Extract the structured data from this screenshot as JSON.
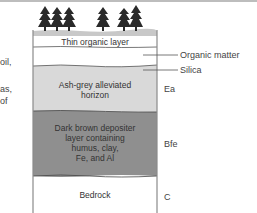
{
  "figure": {
    "left_text_fragments": [
      "oil,",
      "as,",
      "of"
    ],
    "layers": [
      {
        "id": "surface",
        "label": "Thin organic layer",
        "color": "#ffffff"
      },
      {
        "id": "organic_gap",
        "label": "",
        "color": "#ffffff"
      },
      {
        "id": "ea",
        "label": "Ash-grey alleviated horizon",
        "lines": [
          "Ash-grey alleviated",
          "horizon"
        ],
        "color": "#d9d9d9",
        "horizon": "Ea"
      },
      {
        "id": "bfe",
        "label": "Dark brown depositer layer containing humus, clay, Fe, and Al",
        "lines": [
          "Dark brown depositer",
          "layer containing",
          "humus, clay,",
          "Fe, and Al"
        ],
        "color": "#8f8f8f",
        "horizon": "Bfe"
      },
      {
        "id": "c",
        "label": "Bedrock",
        "lines": [
          "Bedrock"
        ],
        "color": "#ffffff",
        "horizon": "C"
      }
    ],
    "callouts": [
      {
        "label": "Organic matter"
      },
      {
        "label": "Silica"
      }
    ],
    "icons": {
      "trees": "conifer-tree-icon",
      "tree_count": 6
    },
    "colors": {
      "ground": "#c8c8c8",
      "border": "#8a8a8a",
      "tree": "#2a2a2a"
    }
  }
}
